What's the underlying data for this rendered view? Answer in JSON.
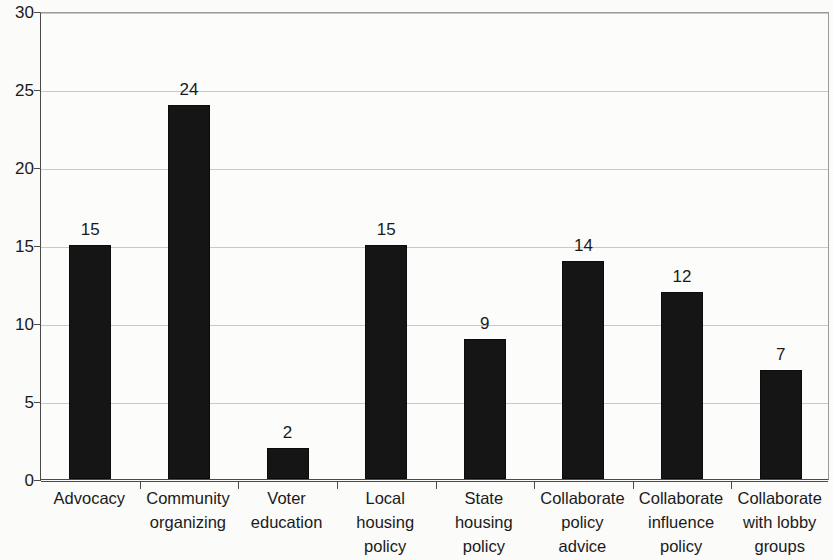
{
  "chart_data": {
    "type": "bar",
    "title": "",
    "subtitle": "",
    "xlabel": "",
    "ylabel": "",
    "categories": [
      "Advocacy",
      "Community organizing",
      "Voter education",
      "Local housing policy",
      "State housing policy",
      "Collaborate policy advice",
      "Collaborate influence policy",
      "Collaborate with lobby groups"
    ],
    "category_lines": [
      [
        "Advocacy"
      ],
      [
        "Community",
        "organizing"
      ],
      [
        "Voter",
        "education"
      ],
      [
        "Local",
        "housing",
        "policy"
      ],
      [
        "State",
        "housing",
        "policy"
      ],
      [
        "Collaborate",
        "policy",
        "advice"
      ],
      [
        "Collaborate",
        "influence",
        "policy"
      ],
      [
        "Collaborate",
        "with lobby",
        "groups"
      ]
    ],
    "values": [
      15,
      24,
      2,
      15,
      9,
      14,
      12,
      7
    ],
    "data_labels": [
      "15",
      "24",
      "2",
      "15",
      "9",
      "14",
      "12",
      "7"
    ],
    "ylim": [
      0,
      30
    ],
    "ytick_values": [
      0,
      5,
      10,
      15,
      20,
      25,
      30
    ],
    "ytick_labels": [
      "0",
      "5",
      "10",
      "15",
      "20",
      "25",
      "30"
    ],
    "grid": true,
    "grid_axis": "y",
    "legend": false,
    "legend_position": "none",
    "bar_color": "#151515",
    "grid_color": "#c9c9c9",
    "axis_color": "#4a4a4a",
    "background_color": "#fbfbfa",
    "text_color": "#1a1a1a"
  }
}
